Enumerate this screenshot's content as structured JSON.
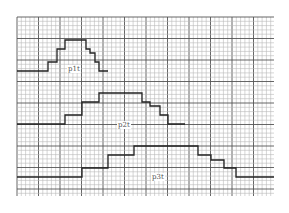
{
  "diagram": {
    "type": "step-pulses-on-graph-paper",
    "grid": {
      "x0": 17,
      "y0": 17,
      "x1": 274,
      "y1": 196,
      "minor_step": 4.3,
      "major_every": 5,
      "minor_color": "#b8b8b8",
      "major_color": "#555555"
    },
    "line_color": "#222222",
    "pulses": [
      {
        "label": "p1t",
        "label_pos": [
          67,
          65
        ],
        "points": [
          [
            17,
            71
          ],
          [
            48,
            71
          ],
          [
            48,
            62
          ],
          [
            57,
            62
          ],
          [
            57,
            49
          ],
          [
            65,
            49
          ],
          [
            65,
            40
          ],
          [
            86,
            40
          ],
          [
            86,
            49
          ],
          [
            90,
            49
          ],
          [
            90,
            53
          ],
          [
            95,
            53
          ],
          [
            95,
            62
          ],
          [
            99,
            62
          ],
          [
            99,
            71
          ],
          [
            108,
            71
          ]
        ]
      },
      {
        "label": "p2t",
        "label_pos": [
          117,
          121
        ],
        "points": [
          [
            17,
            124
          ],
          [
            65,
            124
          ],
          [
            65,
            115
          ],
          [
            82,
            115
          ],
          [
            82,
            102
          ],
          [
            99,
            102
          ],
          [
            99,
            93
          ],
          [
            142,
            93
          ],
          [
            142,
            102
          ],
          [
            150,
            102
          ],
          [
            150,
            106
          ],
          [
            160,
            106
          ],
          [
            160,
            115
          ],
          [
            168,
            115
          ],
          [
            168,
            124
          ],
          [
            185,
            124
          ]
        ]
      },
      {
        "label": "p3t",
        "label_pos": [
          151,
          173
        ],
        "points": [
          [
            17,
            177
          ],
          [
            82,
            177
          ],
          [
            82,
            168
          ],
          [
            108,
            168
          ],
          [
            108,
            155
          ],
          [
            134,
            155
          ],
          [
            134,
            146
          ],
          [
            198,
            146
          ],
          [
            198,
            155
          ],
          [
            211,
            155
          ],
          [
            211,
            160
          ],
          [
            224,
            160
          ],
          [
            224,
            168
          ],
          [
            236,
            168
          ],
          [
            236,
            177
          ],
          [
            274,
            177
          ]
        ]
      }
    ]
  }
}
